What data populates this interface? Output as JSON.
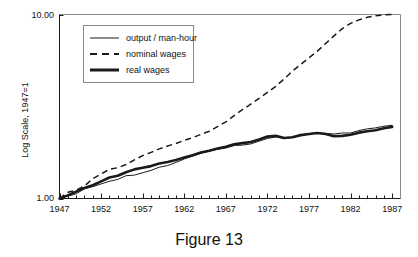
{
  "figure": {
    "caption": "Figure 13"
  },
  "chart_data": {
    "type": "line",
    "title": "",
    "subtitle": "",
    "xlabel": "",
    "ylabel": "Log Scale, 1947=1",
    "yscale": "log",
    "ylim": [
      1.0,
      10.0
    ],
    "xlim": [
      1947,
      1988
    ],
    "grid": false,
    "legend_position": "top-left-inside",
    "ytick_labels": [
      "1.00",
      "10.00"
    ],
    "ytick_values": [
      1.0,
      10.0
    ],
    "xtick_labels": [
      "1947",
      "1952",
      "1957",
      "1962",
      "1967",
      "1972",
      "1977",
      "1982",
      "1987"
    ],
    "xtick_values": [
      1947,
      1952,
      1957,
      1962,
      1967,
      1972,
      1977,
      1982,
      1987
    ],
    "x_minor_ticks_every": 1,
    "x": [
      1947,
      1948,
      1949,
      1950,
      1951,
      1952,
      1953,
      1954,
      1955,
      1956,
      1957,
      1958,
      1959,
      1960,
      1961,
      1962,
      1963,
      1964,
      1965,
      1966,
      1967,
      1968,
      1969,
      1970,
      1971,
      1972,
      1973,
      1974,
      1975,
      1976,
      1977,
      1978,
      1979,
      1980,
      1981,
      1982,
      1983,
      1984,
      1985,
      1986,
      1987
    ],
    "series": [
      {
        "name": "output / man-hour",
        "style": "thin-solid",
        "color": "#1a1a1a",
        "values": [
          1.0,
          1.03,
          1.06,
          1.13,
          1.16,
          1.2,
          1.24,
          1.27,
          1.33,
          1.34,
          1.38,
          1.42,
          1.48,
          1.51,
          1.57,
          1.64,
          1.7,
          1.76,
          1.81,
          1.85,
          1.88,
          1.94,
          1.95,
          1.98,
          2.05,
          2.12,
          2.16,
          2.12,
          2.15,
          2.21,
          2.25,
          2.27,
          2.26,
          2.24,
          2.27,
          2.27,
          2.34,
          2.39,
          2.42,
          2.47,
          2.5
        ]
      },
      {
        "name": "nominal wages",
        "style": "dashed",
        "color": "#1a1a1a",
        "values": [
          1.0,
          1.08,
          1.11,
          1.17,
          1.28,
          1.36,
          1.44,
          1.47,
          1.53,
          1.62,
          1.71,
          1.78,
          1.86,
          1.93,
          1.99,
          2.07,
          2.14,
          2.23,
          2.32,
          2.46,
          2.61,
          2.82,
          3.04,
          3.26,
          3.5,
          3.77,
          4.07,
          4.46,
          4.92,
          5.35,
          5.81,
          6.32,
          6.95,
          7.65,
          8.38,
          8.95,
          9.35,
          9.65,
          9.85,
          9.95,
          10.0
        ]
      },
      {
        "name": "real wages",
        "style": "thick-solid",
        "color": "#1a1a1a",
        "values": [
          1.0,
          1.04,
          1.09,
          1.14,
          1.18,
          1.24,
          1.3,
          1.33,
          1.39,
          1.44,
          1.47,
          1.5,
          1.55,
          1.58,
          1.62,
          1.67,
          1.72,
          1.78,
          1.82,
          1.87,
          1.91,
          1.97,
          2.0,
          2.03,
          2.09,
          2.17,
          2.19,
          2.13,
          2.15,
          2.21,
          2.24,
          2.27,
          2.24,
          2.18,
          2.19,
          2.22,
          2.28,
          2.32,
          2.35,
          2.41,
          2.45
        ]
      }
    ],
    "legend_entries": [
      {
        "label": "output / man-hour",
        "style": "thin-solid"
      },
      {
        "label": "nominal wages",
        "style": "dashed"
      },
      {
        "label": "real wages",
        "style": "thick-solid"
      }
    ]
  }
}
